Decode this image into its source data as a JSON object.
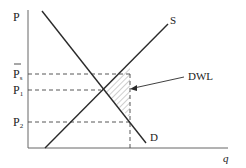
{
  "diagram": {
    "type": "supply-demand-deadweight-loss",
    "axes": {
      "y_label": "P",
      "x_label": "q"
    },
    "price_levels": [
      {
        "label": "P̅s",
        "base": "P",
        "subscript": "s",
        "overbar": true,
        "y": 74
      },
      {
        "label": "P1",
        "base": "P",
        "subscript": "1",
        "y": 90
      },
      {
        "label": "P2",
        "base": "P",
        "subscript": "2",
        "y": 122
      }
    ],
    "curves": [
      {
        "name": "supply",
        "label": "S"
      },
      {
        "name": "demand",
        "label": "D"
      }
    ],
    "annotation": {
      "label": "DWL"
    },
    "colors": {
      "line": "#2a2a2a",
      "axis": "#555555",
      "dash": "#444444",
      "hatch": "#777777"
    }
  }
}
